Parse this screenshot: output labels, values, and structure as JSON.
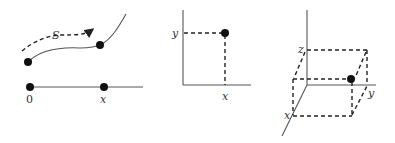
{
  "figure": {
    "panels": [
      {
        "id": "arc-length-1d",
        "labels": {
          "arc": "S",
          "origin": "0",
          "position": "x"
        }
      },
      {
        "id": "coordinates-2d",
        "labels": {
          "y_axis": "y",
          "x_axis": "x"
        }
      },
      {
        "id": "coordinates-3d",
        "labels": {
          "z_axis": "z",
          "y_axis": "y",
          "x_axis": "x"
        }
      }
    ],
    "colors": {
      "line": "#555555",
      "dash": "#222222",
      "dot": "#111111",
      "background": "#ffffff"
    }
  }
}
